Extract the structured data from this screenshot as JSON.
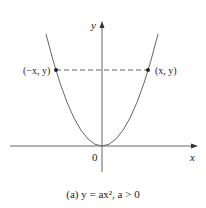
{
  "figure": {
    "caption": "(a)  y = ax², a > 0",
    "y_axis_label": "y",
    "x_axis_label": "x",
    "origin_label": "0",
    "left_point_label": "(−x, y)",
    "right_point_label": "(x, y)"
  },
  "colors": {
    "stroke": "#555555",
    "text": "#222222"
  }
}
